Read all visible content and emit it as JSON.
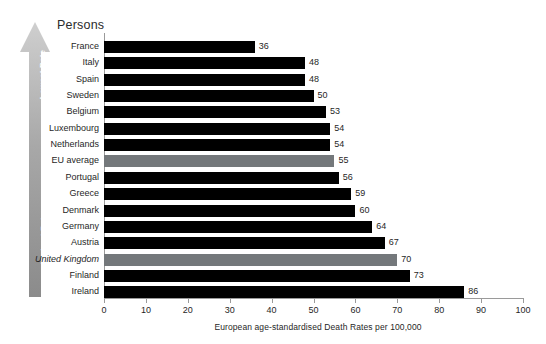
{
  "chart_data": {
    "type": "bar",
    "orientation": "horizontal",
    "title": "Persons",
    "xlabel": "European age-standardised Death Rates per 100,000",
    "ylabel": "",
    "xlim": [
      0,
      100
    ],
    "xticks": [
      0,
      10,
      20,
      30,
      40,
      50,
      60,
      70,
      80,
      90,
      100
    ],
    "xtick_labels": [
      "0",
      "10",
      "20",
      "30",
      "40",
      "50",
      "60",
      "70",
      "80",
      "90",
      "100"
    ],
    "grid": false,
    "legend": "none",
    "categories": [
      "France",
      "Italy",
      "Spain",
      "Sweden",
      "Belgium",
      "Luxembourg",
      "Netherlands",
      "EU average",
      "Portugal",
      "Greece",
      "Denmark",
      "Germany",
      "Austria",
      "United Kingdom",
      "Finland",
      "Ireland"
    ],
    "values": [
      36,
      48,
      48,
      50,
      53,
      54,
      54,
      55,
      56,
      59,
      60,
      64,
      67,
      70,
      73,
      86
    ],
    "bars": [
      {
        "label": "France",
        "value": 36,
        "value_label": "36",
        "style": "normal",
        "italic": false
      },
      {
        "label": "Italy",
        "value": 48,
        "value_label": "48",
        "style": "normal",
        "italic": false
      },
      {
        "label": "Spain",
        "value": 48,
        "value_label": "48",
        "style": "normal",
        "italic": false
      },
      {
        "label": "Sweden",
        "value": 50,
        "value_label": "50",
        "style": "normal",
        "italic": false
      },
      {
        "label": "Belgium",
        "value": 53,
        "value_label": "53",
        "style": "normal",
        "italic": false
      },
      {
        "label": "Luxembourg",
        "value": 54,
        "value_label": "54",
        "style": "normal",
        "italic": false
      },
      {
        "label": "Netherlands",
        "value": 54,
        "value_label": "54",
        "style": "normal",
        "italic": false
      },
      {
        "label": "EU average",
        "value": 55,
        "value_label": "55",
        "style": "highlight",
        "italic": false
      },
      {
        "label": "Portugal",
        "value": 56,
        "value_label": "56",
        "style": "normal",
        "italic": false
      },
      {
        "label": "Greece",
        "value": 59,
        "value_label": "59",
        "style": "normal",
        "italic": false
      },
      {
        "label": "Denmark",
        "value": 60,
        "value_label": "60",
        "style": "normal",
        "italic": false
      },
      {
        "label": "Germany",
        "value": 64,
        "value_label": "64",
        "style": "normal",
        "italic": false
      },
      {
        "label": "Austria",
        "value": 67,
        "value_label": "67",
        "style": "normal",
        "italic": false
      },
      {
        "label": "United Kingdom",
        "value": 70,
        "value_label": "70",
        "style": "highlight",
        "italic": true
      },
      {
        "label": "Finland",
        "value": 73,
        "value_label": "73",
        "style": "normal",
        "italic": false
      },
      {
        "label": "Ireland",
        "value": 86,
        "value_label": "86",
        "style": "normal",
        "italic": false
      }
    ],
    "colors": {
      "bar": "#000000",
      "bar_highlight": "#74787b",
      "axis": "#9a9a9a",
      "text": "#1f1f1f",
      "background": "#ffffff",
      "arrow_top": "#c9c9c9",
      "arrow_bottom": "#8a8a8a"
    }
  },
  "annotations": {
    "arrow_top_label": "Lowest Rate",
    "arrow_bottom_label": "Highest Rate"
  }
}
